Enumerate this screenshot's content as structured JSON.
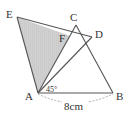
{
  "figure": {
    "points": {
      "A": "A",
      "B": "B",
      "C": "C",
      "D": "D",
      "E": "E",
      "F": "F"
    },
    "angle_label": "45°",
    "length_label": "8cm",
    "shaded_region": "triangle AEF",
    "colors": {
      "line": "#555555",
      "shade": "#c8c8c8",
      "dashed": "#9a9a9a"
    }
  }
}
